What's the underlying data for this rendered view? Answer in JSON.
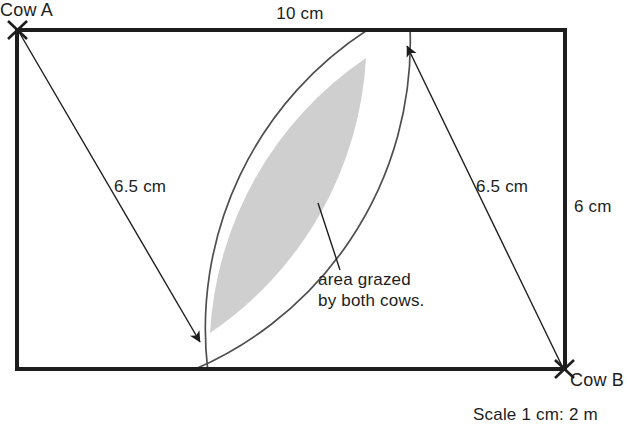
{
  "figure": {
    "title_visible": false,
    "field": {
      "top_label": "10 cm",
      "right_label": "6 cm",
      "width_cm": 10,
      "height_cm": 6,
      "stroke_color": "#1d1d1d"
    },
    "cows": [
      {
        "id": "cow-a",
        "label": "Cow A",
        "corner": "top-left",
        "radius_label": "6.5 cm",
        "radius_cm": 6.5
      },
      {
        "id": "cow-b",
        "label": "Cow B",
        "corner": "bottom-right",
        "radius_label": "6.5 cm",
        "radius_cm": 6.5
      }
    ],
    "overlap": {
      "callout_line_1": "area grazed",
      "callout_line_2": "by both cows.",
      "fill_color": "#cfcfcf",
      "stroke_color": "#5a5a5a"
    },
    "scale_note": "Scale 1 cm: 2 m"
  }
}
